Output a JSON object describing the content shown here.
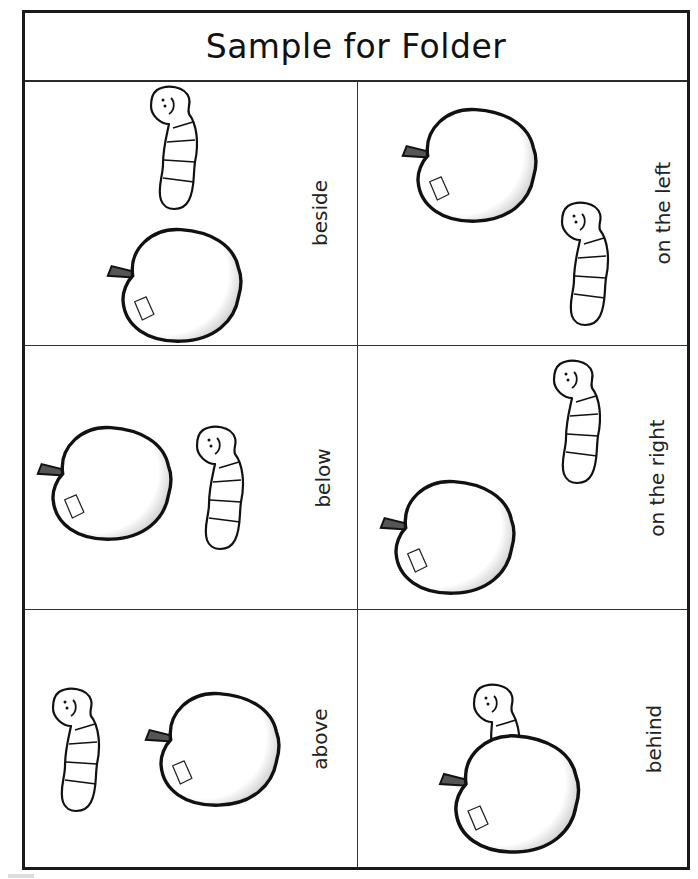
{
  "worksheet": {
    "title": "Sample for Folder",
    "cells": [
      {
        "position": "row1-col1",
        "label": "beside",
        "scene": "worm above-right of apple"
      },
      {
        "position": "row1-col2",
        "label": "on the left",
        "scene": "apple left, worm lower-right"
      },
      {
        "position": "row2-col1",
        "label": "below",
        "scene": "apple left, worm right"
      },
      {
        "position": "row2-col2",
        "label": "on the right",
        "scene": "worm upper-right, apple lower-left"
      },
      {
        "position": "row3-col1",
        "label": "above",
        "scene": "worm left, apple right"
      },
      {
        "position": "row3-col2",
        "label": "behind",
        "scene": "worm peeking over top of apple"
      }
    ]
  },
  "icons": {
    "apple": "apple-icon",
    "worm": "worm-icon"
  },
  "colors": {
    "ink": "#1a1a1a",
    "paper": "#ffffff",
    "shading": "#9a9a9a"
  }
}
